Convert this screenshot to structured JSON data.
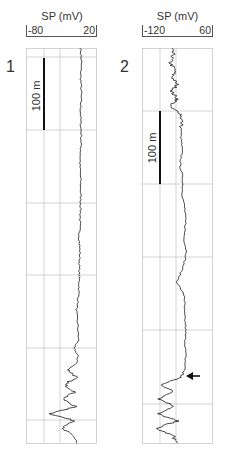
{
  "figure": {
    "panels": [
      {
        "id": "1",
        "label": "1",
        "axis_title": "SP (mV)",
        "axis_min_label": "-80",
        "axis_max_label": "20",
        "scale_bar_label": "100 m"
      },
      {
        "id": "2",
        "label": "2",
        "axis_title": "SP (mV)",
        "axis_min_label": "-120",
        "axis_max_label": "60",
        "scale_bar_label": "100 m"
      }
    ],
    "colors": {
      "grid": "#c8c8c8",
      "trace": "#1a1a1a",
      "scale_bar": "#111111",
      "frame": "#bdbdbd"
    }
  },
  "chart_data": [
    {
      "type": "line",
      "title": "Well 1 — Spontaneous Potential log",
      "xlabel": "SP (mV)",
      "ylabel": "Depth (scale bar = 100 m)",
      "xlim": [
        -80,
        20
      ],
      "x_ticks": [
        -80,
        20
      ],
      "grid": true,
      "vertical_gridlines_mV": [
        -55,
        -35,
        -15,
        20
      ],
      "horizontal_gridline_spacing_m": 100,
      "depth_extent_m": 540,
      "annotations": [
        "100 m scale bar"
      ],
      "series": [
        {
          "name": "SP",
          "depth_m": [
            0,
            20,
            40,
            60,
            80,
            100,
            120,
            140,
            160,
            180,
            200,
            220,
            240,
            260,
            280,
            300,
            320,
            340,
            360,
            380,
            400,
            410,
            420,
            430,
            440,
            450,
            460,
            470,
            480,
            490,
            500,
            510,
            520,
            530,
            540
          ],
          "values_mV": [
            -2,
            -1,
            -2,
            -1,
            -2,
            -2,
            -1,
            -2,
            -3,
            -2,
            -2,
            -2,
            -3,
            -4,
            -3,
            -4,
            -4,
            -5,
            -8,
            -6,
            -5,
            -12,
            -6,
            -7,
            -20,
            -8,
            -25,
            -10,
            -28,
            -9,
            -45,
            -10,
            -30,
            -12,
            -8
          ]
        }
      ]
    },
    {
      "type": "line",
      "title": "Well 2 — Spontaneous Potential log",
      "xlabel": "SP (mV)",
      "ylabel": "Depth (scale bar = 100 m)",
      "xlim": [
        -120,
        60
      ],
      "x_ticks": [
        -120,
        60
      ],
      "grid": true,
      "vertical_gridlines_mV": [
        -70,
        -25,
        20,
        60
      ],
      "horizontal_gridline_spacing_m": 100,
      "depth_extent_m": 540,
      "annotations": [
        "100 m scale bar",
        "arrow at ~450 m marking transition to high-amplitude interval"
      ],
      "series": [
        {
          "name": "SP",
          "depth_m": [
            0,
            10,
            20,
            30,
            40,
            50,
            60,
            70,
            80,
            90,
            100,
            120,
            140,
            160,
            180,
            200,
            220,
            240,
            260,
            280,
            300,
            320,
            340,
            360,
            380,
            400,
            420,
            440,
            450,
            460,
            470,
            480,
            490,
            500,
            510,
            520,
            530,
            540
          ],
          "values_mV": [
            -45,
            -40,
            -48,
            -35,
            -42,
            -30,
            -44,
            -28,
            -50,
            -20,
            -18,
            -20,
            -17,
            -22,
            -15,
            -16,
            -10,
            -8,
            -12,
            -5,
            -15,
            -30,
            -10,
            -12,
            -8,
            -9,
            -8,
            -10,
            -20,
            -70,
            -40,
            -75,
            -35,
            -80,
            -30,
            -85,
            -40,
            -30
          ]
        }
      ]
    }
  ]
}
